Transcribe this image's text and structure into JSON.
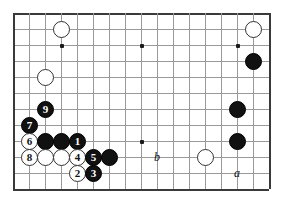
{
  "diagram": {
    "board": {
      "origin_x": 13,
      "origin_y": 13,
      "spacing": 16,
      "cols": 17,
      "rows": 12,
      "grid_color": "#9a9a9a",
      "edge_color": "#3a3a3a",
      "background": "#ffffff"
    },
    "star_points": [
      {
        "col": 3,
        "row": 2
      },
      {
        "col": 8,
        "row": 2
      },
      {
        "col": 14,
        "row": 2
      },
      {
        "col": 8,
        "row": 8
      }
    ],
    "stones": [
      {
        "col": 3,
        "row": 1,
        "color": "white",
        "label": ""
      },
      {
        "col": 15,
        "row": 1,
        "color": "white",
        "label": ""
      },
      {
        "col": 15,
        "row": 3,
        "color": "black",
        "label": ""
      },
      {
        "col": 2,
        "row": 4,
        "color": "white",
        "label": ""
      },
      {
        "col": 2,
        "row": 6,
        "color": "black",
        "label": "9"
      },
      {
        "col": 14,
        "row": 6,
        "color": "black",
        "label": ""
      },
      {
        "col": 1,
        "row": 7,
        "color": "black",
        "label": "7"
      },
      {
        "col": 1,
        "row": 8,
        "color": "white",
        "label": "6"
      },
      {
        "col": 2,
        "row": 8,
        "color": "black",
        "label": ""
      },
      {
        "col": 3,
        "row": 8,
        "color": "black",
        "label": ""
      },
      {
        "col": 4,
        "row": 8,
        "color": "black",
        "label": "1"
      },
      {
        "col": 14,
        "row": 8,
        "color": "black",
        "label": ""
      },
      {
        "col": 1,
        "row": 9,
        "color": "white",
        "label": "8"
      },
      {
        "col": 2,
        "row": 9,
        "color": "white",
        "label": ""
      },
      {
        "col": 3,
        "row": 9,
        "color": "white",
        "label": ""
      },
      {
        "col": 4,
        "row": 9,
        "color": "white",
        "label": "4"
      },
      {
        "col": 5,
        "row": 9,
        "color": "black",
        "label": "5"
      },
      {
        "col": 6,
        "row": 9,
        "color": "black",
        "label": ""
      },
      {
        "col": 12,
        "row": 9,
        "color": "white",
        "label": ""
      },
      {
        "col": 4,
        "row": 10,
        "color": "white",
        "label": "2"
      },
      {
        "col": 5,
        "row": 10,
        "color": "black",
        "label": "3"
      }
    ],
    "point_labels": [
      {
        "col": 9,
        "row": 9,
        "text": "b"
      },
      {
        "col": 14,
        "row": 10,
        "text": "a"
      }
    ],
    "move_sequence": [
      "1",
      "2",
      "3",
      "4",
      "5",
      "6",
      "7",
      "8",
      "9"
    ]
  }
}
